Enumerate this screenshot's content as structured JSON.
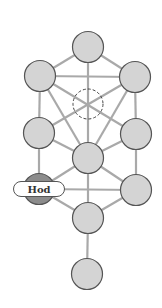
{
  "diagram": {
    "type": "tree-of-life",
    "highlighted_label": "Hod",
    "colors": {
      "node_fill": "#d4d4d4",
      "highlight_fill": "#8c8c8c",
      "line": "#a9a9a9",
      "outline": "#555555"
    },
    "nodes": [
      {
        "id": "kether",
        "x": 88,
        "y": 47
      },
      {
        "id": "binah",
        "x": 40,
        "y": 76
      },
      {
        "id": "chokmah",
        "x": 135,
        "y": 77
      },
      {
        "id": "daath",
        "x": 88,
        "y": 104,
        "hidden": true
      },
      {
        "id": "geburah",
        "x": 39,
        "y": 133
      },
      {
        "id": "chesed",
        "x": 136,
        "y": 134
      },
      {
        "id": "tiphareth",
        "x": 88,
        "y": 158
      },
      {
        "id": "hod",
        "x": 39,
        "y": 189,
        "highlight": true,
        "label": "Hod"
      },
      {
        "id": "netzach",
        "x": 136,
        "y": 190
      },
      {
        "id": "yesod",
        "x": 88,
        "y": 218
      },
      {
        "id": "malkuth",
        "x": 87,
        "y": 274
      }
    ]
  }
}
